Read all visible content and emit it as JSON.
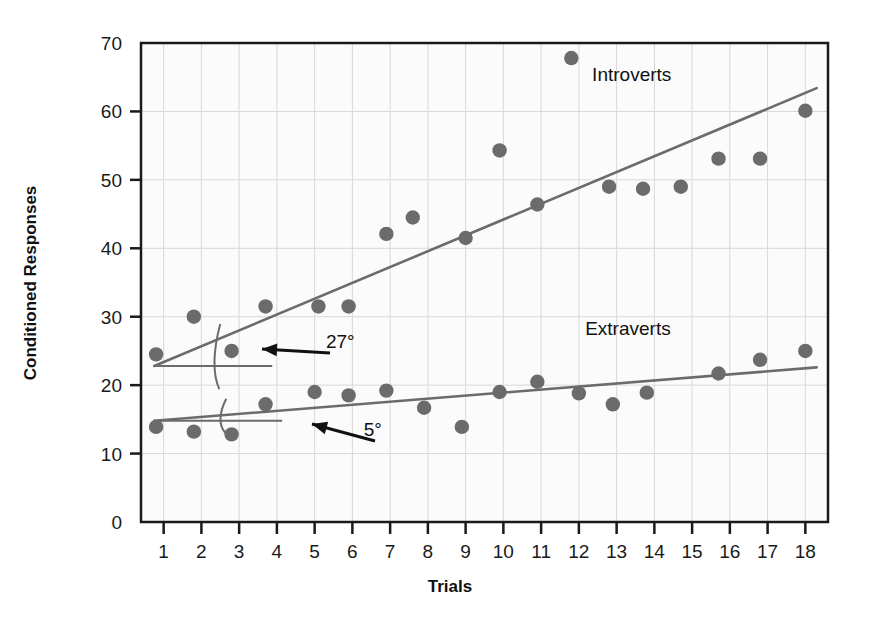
{
  "chart_data": {
    "type": "scatter",
    "title": "",
    "xlabel": "Trials",
    "ylabel": "Conditioned Responses",
    "xlim": [
      0.4,
      18.6
    ],
    "ylim": [
      0,
      70
    ],
    "yticks": [
      0,
      10,
      20,
      30,
      40,
      50,
      60,
      70
    ],
    "xticks": [
      1,
      2,
      3,
      4,
      5,
      6,
      7,
      8,
      9,
      10,
      11,
      12,
      13,
      14,
      15,
      16,
      17,
      18
    ],
    "grid": true,
    "legend_position": "inline-annotation",
    "marker_color": "#6b6b6b",
    "line_color": "#6b6b6b",
    "axis_color": "#1a1a1a",
    "grid_color": "#d8d8d8",
    "plot_background": "#fbfbfb",
    "series": [
      {
        "name": "Introverts",
        "label_x": 13.4,
        "label_y": 64.5,
        "marker_color": "#6b6b6b",
        "points": [
          {
            "x": 0.8,
            "y": 24.5
          },
          {
            "x": 1.8,
            "y": 30.0
          },
          {
            "x": 2.8,
            "y": 25.0
          },
          {
            "x": 3.7,
            "y": 31.5
          },
          {
            "x": 5.1,
            "y": 31.5
          },
          {
            "x": 5.9,
            "y": 31.5
          },
          {
            "x": 6.9,
            "y": 42.1
          },
          {
            "x": 7.6,
            "y": 44.5
          },
          {
            "x": 9.0,
            "y": 41.5
          },
          {
            "x": 9.9,
            "y": 54.3
          },
          {
            "x": 10.9,
            "y": 46.4
          },
          {
            "x": 11.8,
            "y": 67.8
          },
          {
            "x": 12.8,
            "y": 49.0
          },
          {
            "x": 13.7,
            "y": 48.7
          },
          {
            "x": 14.7,
            "y": 49.0
          },
          {
            "x": 15.7,
            "y": 53.1
          },
          {
            "x": 16.8,
            "y": 53.1
          },
          {
            "x": 18.0,
            "y": 60.1
          }
        ],
        "fit_line": {
          "x1": 0.75,
          "y1": 22.8,
          "x2": 18.3,
          "y2": 63.4
        },
        "angle": {
          "value": "27",
          "unit": "°",
          "label": "27°"
        }
      },
      {
        "name": "Extraverts",
        "label_x": 13.3,
        "label_y": 27.4,
        "marker_color": "#6b6b6b",
        "points": [
          {
            "x": 0.8,
            "y": 13.9
          },
          {
            "x": 1.8,
            "y": 13.2
          },
          {
            "x": 2.8,
            "y": 12.8
          },
          {
            "x": 3.7,
            "y": 17.2
          },
          {
            "x": 5.0,
            "y": 19.0
          },
          {
            "x": 5.9,
            "y": 18.5
          },
          {
            "x": 6.9,
            "y": 19.2
          },
          {
            "x": 7.9,
            "y": 16.7
          },
          {
            "x": 8.9,
            "y": 13.9
          },
          {
            "x": 9.9,
            "y": 19.0
          },
          {
            "x": 10.9,
            "y": 20.5
          },
          {
            "x": 12.0,
            "y": 18.8
          },
          {
            "x": 12.9,
            "y": 17.2
          },
          {
            "x": 13.8,
            "y": 18.9
          },
          {
            "x": 15.7,
            "y": 21.7
          },
          {
            "x": 16.8,
            "y": 23.7
          },
          {
            "x": 18.0,
            "y": 25.0
          }
        ],
        "fit_line": {
          "x1": 0.75,
          "y1": 14.8,
          "x2": 18.3,
          "y2": 22.6
        },
        "angle": {
          "value": "5",
          "unit": "°",
          "label": "5°"
        }
      }
    ],
    "annotations": [
      {
        "name": "introverts-angle",
        "text": "27°",
        "x": 5.3,
        "y": 25.4
      },
      {
        "name": "extraverts-angle",
        "text": "5°",
        "x": 6.3,
        "y": 12.5
      }
    ]
  }
}
